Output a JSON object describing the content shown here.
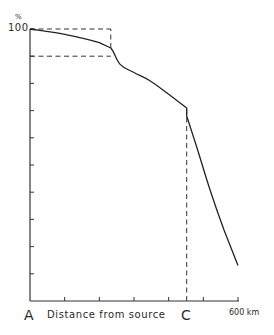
{
  "chart_data": {
    "type": "line",
    "title": "",
    "xlabel": "Distance from source",
    "ylabel": "%",
    "x_unit": "km",
    "xlim": [
      0,
      600
    ],
    "ylim": [
      0,
      100
    ],
    "x_ticks": [
      0,
      100,
      200,
      300,
      400,
      500,
      600
    ],
    "x_tick_labels": {
      "0": "A",
      "600": "600 km"
    },
    "y_ticks": [
      0,
      10,
      20,
      30,
      40,
      50,
      60,
      70,
      80,
      90,
      100
    ],
    "y_tick_labels": {
      "100": "100"
    },
    "grid": false,
    "series": [
      {
        "name": "curve",
        "x": [
          0,
          100,
          200,
          233,
          260,
          300,
          346,
          400,
          452,
          452,
          480,
          519,
          560,
          600
        ],
        "y": [
          100,
          98,
          95,
          93,
          87,
          84,
          81,
          76,
          71,
          68,
          57,
          41,
          26,
          13
        ]
      }
    ],
    "annotations": [
      {
        "type": "dashed-hline",
        "y": 100,
        "x_from": 0,
        "x_to": 233
      },
      {
        "type": "dashed-hline",
        "y": 90,
        "x_from": 0,
        "x_to": 233
      },
      {
        "type": "dashed-vline",
        "x": 233,
        "y_from": 93,
        "y_to": 100
      },
      {
        "type": "dashed-vline",
        "x": 452,
        "y_from": 0,
        "y_to": 71,
        "label": "C"
      },
      {
        "type": "point-label",
        "x": 0,
        "label": "A"
      }
    ]
  },
  "labels": {
    "y_unit": "%",
    "y_max": "100",
    "point_a": "A",
    "x_axis_title": "Distance from source",
    "point_c": "C",
    "x_max": "600 km"
  }
}
